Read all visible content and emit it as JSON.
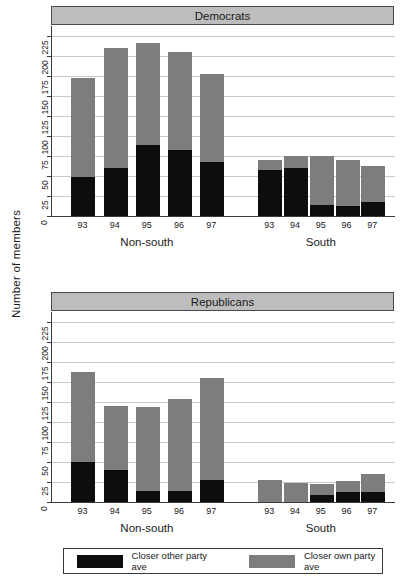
{
  "axis": {
    "ylabel": "Number of members",
    "yticks": [
      0,
      25,
      50,
      75,
      100,
      125,
      150,
      175,
      200,
      225
    ],
    "ymax": 237,
    "xticks": [
      "93",
      "94",
      "95",
      "96",
      "97"
    ],
    "groups": [
      "Non-south",
      "South"
    ]
  },
  "legend": {
    "items": [
      {
        "label": "Closer other party ave",
        "color": "#0d0d0d",
        "key": "other"
      },
      {
        "label": "Closer own party ave",
        "color": "#7d7d7d",
        "key": "own"
      }
    ]
  },
  "panels": [
    {
      "title": "Democrats"
    },
    {
      "title": "Republicans"
    }
  ],
  "chart_data": [
    {
      "type": "bar",
      "title": "Democrats",
      "stacked": true,
      "xlabel": "",
      "ylabel": "Number of members",
      "ylim": [
        0,
        237
      ],
      "yticks": [
        0,
        25,
        50,
        75,
        100,
        125,
        150,
        175,
        200,
        225
      ],
      "grid": true,
      "legend_position": "bottom",
      "groups": [
        "Non-south",
        "South"
      ],
      "categories": [
        "93",
        "94",
        "95",
        "96",
        "97",
        "93",
        "94",
        "95",
        "96",
        "97"
      ],
      "series": [
        {
          "name": "Closer other party ave",
          "color": "#0d0d0d",
          "values": [
            49,
            60,
            88,
            82,
            67,
            57,
            60,
            14,
            13,
            18
          ]
        },
        {
          "name": "Closer own party ave",
          "color": "#7d7d7d",
          "values": [
            123,
            150,
            128,
            122,
            110,
            13,
            15,
            61,
            57,
            44
          ]
        }
      ],
      "totals": [
        172,
        210,
        216,
        204,
        177,
        70,
        75,
        75,
        70,
        62
      ]
    },
    {
      "type": "bar",
      "title": "Republicans",
      "stacked": true,
      "xlabel": "",
      "ylabel": "Number of members",
      "ylim": [
        0,
        237
      ],
      "yticks": [
        0,
        25,
        50,
        75,
        100,
        125,
        150,
        175,
        200,
        225
      ],
      "grid": true,
      "legend_position": "bottom",
      "groups": [
        "Non-south",
        "South"
      ],
      "categories": [
        "93",
        "94",
        "95",
        "96",
        "97",
        "93",
        "94",
        "95",
        "96",
        "97"
      ],
      "series": [
        {
          "name": "Closer other party ave",
          "color": "#0d0d0d",
          "values": [
            50,
            40,
            14,
            14,
            27,
            0,
            0,
            9,
            12,
            13
          ]
        },
        {
          "name": "Closer own party ave",
          "color": "#7d7d7d",
          "values": [
            112,
            80,
            105,
            115,
            128,
            28,
            24,
            14,
            14,
            22
          ]
        }
      ],
      "totals": [
        162,
        120,
        119,
        129,
        155,
        28,
        24,
        23,
        26,
        35
      ]
    }
  ]
}
